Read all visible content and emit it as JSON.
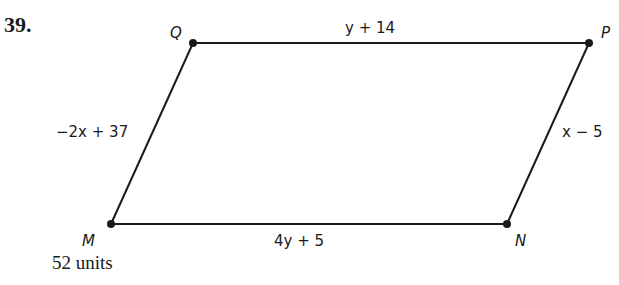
{
  "problem": {
    "number": "39.",
    "answer": "52 units"
  },
  "figure": {
    "shape": "parallelogram",
    "vertices": {
      "Q": {
        "label": "Q",
        "x": 193,
        "y": 43
      },
      "P": {
        "label": "P",
        "x": 589,
        "y": 43
      },
      "N": {
        "label": "N",
        "x": 507,
        "y": 224
      },
      "M": {
        "label": "M",
        "x": 111,
        "y": 224
      }
    },
    "sides": {
      "QP": "y + 14",
      "PN": "x − 5",
      "MN": "4y + 5",
      "QM": "−2x + 37"
    },
    "colors": {
      "stroke": "#1a1a1a",
      "background": "#ffffff"
    }
  }
}
